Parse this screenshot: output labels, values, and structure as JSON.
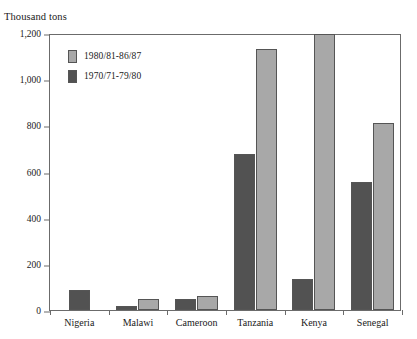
{
  "chart_data": {
    "type": "bar",
    "title": "",
    "subtitle": "",
    "xlabel": "",
    "ylabel": "Thousand tons",
    "ylim": [
      0,
      1200
    ],
    "yticks": [
      0,
      200,
      400,
      600,
      800,
      1000,
      1200
    ],
    "ytick_labels": [
      "0",
      "200",
      "400",
      "600",
      "800",
      "1,000",
      "1,200"
    ],
    "grid": false,
    "legend_position": "top-left-inside",
    "categories": [
      "Nigeria",
      "Malawi",
      "Cameroon",
      "Tanzania",
      "Kenya",
      "Senegal"
    ],
    "series": [
      {
        "name": "1980/81-86/87",
        "color": "#a8a8a8",
        "values": [
          null,
          48,
          61,
          1131,
          1195,
          810
        ]
      },
      {
        "name": "1970/71-79/80",
        "color": "#525252",
        "values": [
          87,
          17,
          48,
          676,
          135,
          554
        ]
      }
    ]
  },
  "legend": {
    "items": [
      {
        "label": "1980/81-86/87",
        "swatch": "light"
      },
      {
        "label": "1970/71-79/80",
        "swatch": "dark"
      }
    ]
  },
  "colors": {
    "light_bar": "#a8a8a8",
    "dark_bar": "#525252",
    "axis": "#6b6b6b",
    "background": "#ffffff",
    "text": "#1a1a1a"
  }
}
